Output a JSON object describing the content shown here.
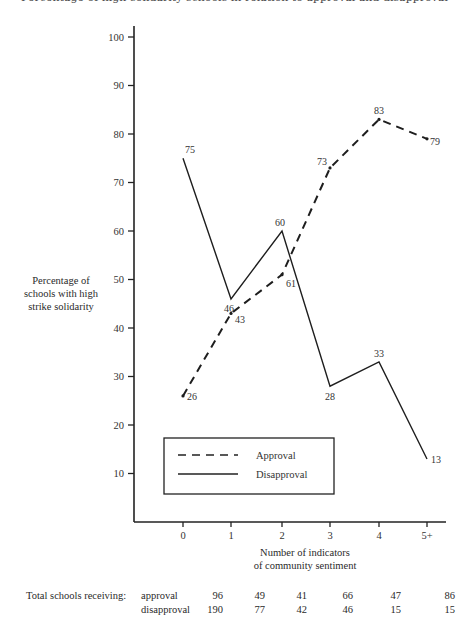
{
  "header": {
    "cut_title": "Percentage of high-solidarity schools in relation to approval and disapproval"
  },
  "chart_data": {
    "type": "line",
    "title": "",
    "xlabel": "Number of indicators of community sentiment",
    "xlabel_lines": [
      "Number of indicators",
      "of community sentiment"
    ],
    "ylabel": "Percentage of schools with high strike solidarity",
    "ylabel_lines": [
      "Percentage of",
      "schools with high",
      "strike solidarity"
    ],
    "categories": [
      "0",
      "1",
      "2",
      "3",
      "4",
      "5+"
    ],
    "yticks": [
      "10",
      "20",
      "30",
      "40",
      "50",
      "60",
      "70",
      "80",
      "90",
      "100"
    ],
    "ylim": [
      0,
      100
    ],
    "grid": false,
    "legend_position": "lower-left inside",
    "series": [
      {
        "name": "Approval",
        "style": "dashed",
        "values": [
          26,
          43,
          51,
          73,
          83,
          79
        ],
        "point_labels": [
          "26",
          "43",
          "61",
          "73",
          "83",
          "79"
        ]
      },
      {
        "name": "Disapproval",
        "style": "solid",
        "values": [
          75,
          46,
          60,
          28,
          33,
          13
        ],
        "point_labels": [
          "75",
          "46",
          "60",
          "28",
          "33",
          "13"
        ]
      }
    ],
    "legend": [
      "Approval",
      "Disapproval"
    ]
  },
  "totals": {
    "label": "Total schools receiving:",
    "rows": [
      {
        "name": "approval",
        "values": [
          "96",
          "49",
          "41",
          "66",
          "47",
          "86"
        ]
      },
      {
        "name": "disapproval",
        "values": [
          "190",
          "77",
          "42",
          "46",
          "15",
          "15"
        ]
      }
    ]
  }
}
